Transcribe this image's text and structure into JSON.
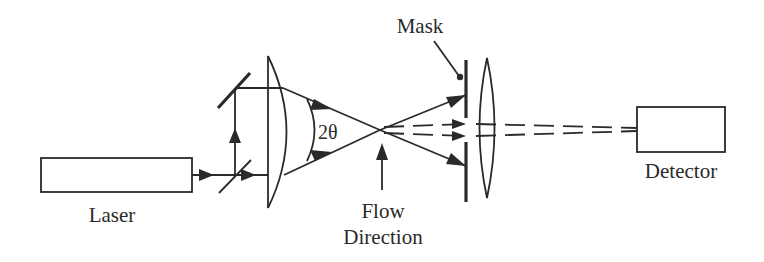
{
  "diagram": {
    "type": "optical-setup",
    "colors": {
      "ink": "#2a2a2a",
      "background": "#ffffff"
    },
    "labels": {
      "laser": "Laser",
      "mask": "Mask",
      "angle": "2θ",
      "flow_line1": "Flow",
      "flow_line2": "Direction",
      "detector": "Detector"
    },
    "components": [
      {
        "id": "laser",
        "label": "Laser"
      },
      {
        "id": "beam-splitter",
        "label": ""
      },
      {
        "id": "mirror",
        "label": ""
      },
      {
        "id": "focusing-lens",
        "label": ""
      },
      {
        "id": "measurement-volume",
        "label": ""
      },
      {
        "id": "mask",
        "label": "Mask"
      },
      {
        "id": "collecting-lens",
        "label": ""
      },
      {
        "id": "detector",
        "label": "Detector"
      }
    ]
  }
}
